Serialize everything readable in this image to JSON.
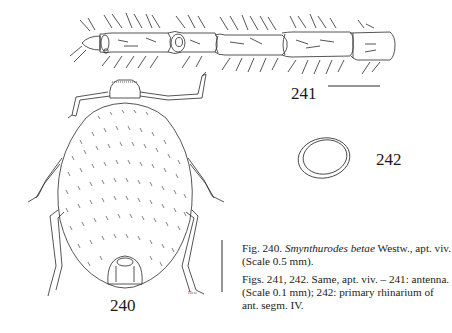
{
  "figures": {
    "fig240": {
      "number": "240",
      "subject": "Smynthurodes betae, apterous viviparous female, dorsal view"
    },
    "fig241": {
      "number": "241",
      "subject": "antenna"
    },
    "fig242": {
      "number": "242",
      "subject": "primary rhinarium of antennal segment IV"
    }
  },
  "captions": {
    "c1_prefix": "Fig. 240.",
    "c1_species": "Smynthurodes betae",
    "c1_author": "Westw.,",
    "c1_rest": "apt. viv. (Scale 0.5 mm).",
    "c2": "Figs. 241, 242. Same, apt. viv. – 241: antenna. (Scale 0.1 mm); 242: primary rhinarium of ant. segm. IV."
  },
  "scale_bars": {
    "fig240": "0.5 mm",
    "fig241": "0.1 mm"
  },
  "artist_signature": "Heie",
  "colors": {
    "ink": "#2a2a2a",
    "paper": "#ffffff"
  }
}
